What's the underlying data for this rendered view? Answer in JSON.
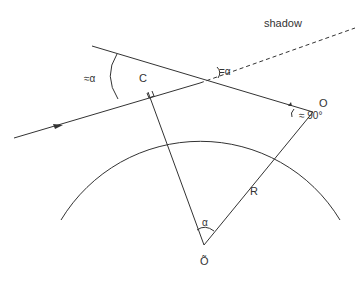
{
  "diagram": {
    "labels": {
      "shadow": "shadow",
      "angle_left": "≈α",
      "angle_top": "=α",
      "point_c": "C",
      "point_o": "O",
      "right_angle": "≈ 90°",
      "radius": "R",
      "center_angle": "α",
      "center": "Õ"
    },
    "colors": {
      "line": "#333333",
      "background": "#ffffff"
    }
  }
}
